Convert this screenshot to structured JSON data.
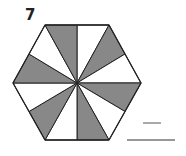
{
  "problem": {
    "number": "7",
    "shape": "hexagon",
    "total_parts": 12,
    "shaded_parts": 6,
    "shaded_color": "#888888",
    "unshaded_color": "#ffffff",
    "outline_color": "#222222",
    "answer": {
      "numerator": "",
      "denominator": ""
    }
  }
}
